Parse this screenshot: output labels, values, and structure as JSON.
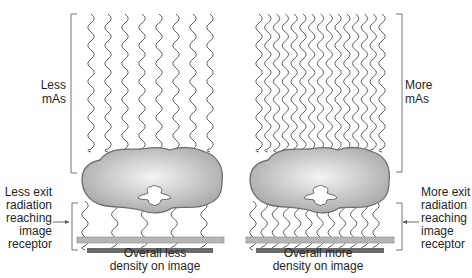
{
  "panels": [
    {
      "id": "less",
      "mas_label": [
        "Less",
        "mAs"
      ],
      "exit_label": [
        "Less exit",
        "radiation",
        "reaching",
        "image",
        "receptor"
      ],
      "caption": [
        "Overall less",
        "density on image"
      ],
      "wave_count": 8,
      "wave_x_start": 91,
      "wave_x_end": 210,
      "exit_wave_count": 5
    },
    {
      "id": "more",
      "mas_label": [
        "More",
        "mAs"
      ],
      "exit_label": [
        "More exit",
        "radiation",
        "reaching",
        "image",
        "receptor"
      ],
      "caption": [
        "Overall more",
        "density on image"
      ],
      "wave_count": 15,
      "wave_x_start": 259,
      "wave_x_end": 382,
      "exit_wave_count": 12
    }
  ],
  "colors": {
    "wave": "#4a4a4a",
    "bracket": "#777777",
    "body_fill_center": "#f2f2f2",
    "body_fill_edge": "#a9a9a9",
    "body_stroke": "#6e6e6e",
    "receptor_light": "#b5b5b5",
    "receptor_dark": "#6a6a6a"
  }
}
